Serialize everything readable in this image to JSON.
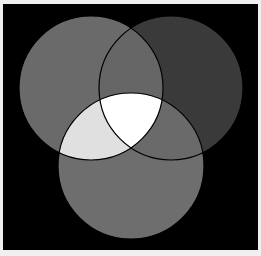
{
  "diagram": {
    "type": "venn",
    "background": "#000000",
    "border_color": "#f0f0f0",
    "stroke_color": "#000000",
    "circles": [
      {
        "id": "left",
        "cx": 91,
        "cy": 88,
        "r": 72,
        "fill": "#6a6a6a"
      },
      {
        "id": "right",
        "cx": 171,
        "cy": 88,
        "r": 72,
        "fill": "#3a3a3a"
      },
      {
        "id": "bottom",
        "cx": 131,
        "cy": 166,
        "r": 73,
        "fill": "#6e6e6e"
      }
    ],
    "regions": {
      "left_right": "#666666",
      "left_bottom": "#e0e0e0",
      "right_bottom": "#6a6a6a",
      "all_three": "#ffffff"
    }
  }
}
